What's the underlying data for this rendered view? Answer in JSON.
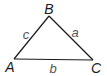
{
  "diagram": {
    "type": "triangle",
    "colors": {
      "stroke": "#1a1a1a",
      "vertex_label": "#1a1a1a",
      "side_label": "#555555",
      "background": "#ffffff"
    },
    "vertices": [
      {
        "id": "A",
        "label": "A",
        "x": 14,
        "y": 59
      },
      {
        "id": "B",
        "label": "B",
        "x": 49,
        "y": 16
      },
      {
        "id": "C",
        "label": "C",
        "x": 93,
        "y": 60
      }
    ],
    "sides": [
      {
        "id": "a",
        "label": "a",
        "from": "B",
        "to": "C"
      },
      {
        "id": "b",
        "label": "b",
        "from": "A",
        "to": "C"
      },
      {
        "id": "c",
        "label": "c",
        "from": "A",
        "to": "B"
      }
    ]
  }
}
